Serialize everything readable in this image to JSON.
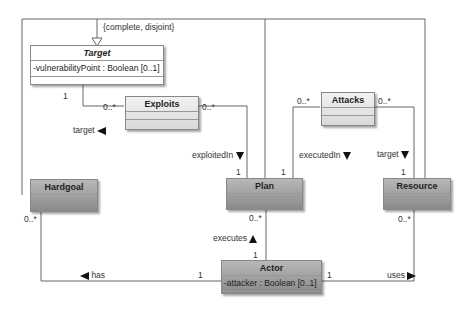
{
  "generalization": {
    "constraint": "{complete, disjoint}"
  },
  "classes": {
    "target": {
      "name": "Target",
      "attribute": "-vulnerabilityPoint : Boolean [0..1]"
    },
    "exploits": {
      "name": "Exploits"
    },
    "attacks": {
      "name": "Attacks"
    },
    "hardgoal": {
      "name": "Hardgoal"
    },
    "plan": {
      "name": "Plan"
    },
    "resource": {
      "name": "Resource"
    },
    "actor": {
      "name": "Actor",
      "attribute": "-attacker : Boolean [0..1]"
    }
  },
  "associations": {
    "exploits_target": {
      "role": "target",
      "mult_target": "1",
      "mult_exploits": "0..*"
    },
    "exploits_plan": {
      "role": "exploitedIn",
      "mult_exploits": "0..*",
      "mult_plan": "1"
    },
    "attacks_plan": {
      "role": "executedIn",
      "mult_attacks": "0..*",
      "mult_plan": "1"
    },
    "attacks_resource": {
      "role": "target",
      "mult_attacks": "0..*",
      "mult_resource": "1"
    },
    "actor_plan": {
      "role": "executes",
      "mult_plan": "0..*",
      "mult_actor": "1"
    },
    "actor_hardgoal": {
      "role": "has",
      "mult_hardgoal": "0..*",
      "mult_actor": "1"
    },
    "actor_resource": {
      "role": "uses",
      "mult_actor": "1",
      "mult_resource": "0..*"
    }
  },
  "icons": {
    "direction_left": "black-triangle-left",
    "direction_right": "black-triangle-right",
    "direction_down": "black-triangle-down",
    "direction_up": "black-triangle-up",
    "generalization": "hollow-triangle-arrow"
  }
}
